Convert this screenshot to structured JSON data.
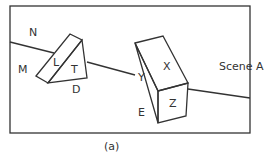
{
  "figure": {
    "scene_label": "Scene A",
    "caption": "(a)",
    "region_labels": {
      "N": "N",
      "M": "M",
      "L": "L",
      "T": "T",
      "D": "D",
      "Y": "Y",
      "X": "X",
      "E": "E",
      "Z": "Z"
    }
  }
}
